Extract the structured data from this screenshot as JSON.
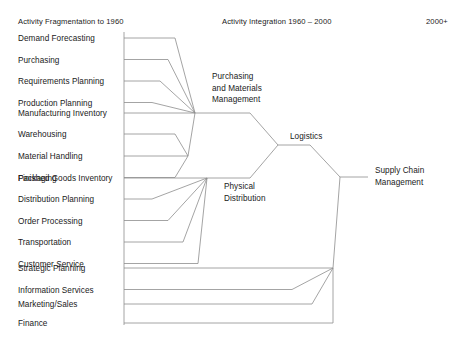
{
  "diagram": {
    "headers": [
      {
        "text": "Activity Fragmentation to 1960",
        "x": 18,
        "y": 17
      },
      {
        "text": "Activity Integration 1960 – 2000",
        "x": 222,
        "y": 17
      },
      {
        "text": "2000+",
        "x": 426,
        "y": 17
      }
    ],
    "spine": {
      "x": 124,
      "y_top": 32,
      "y_bottom": 325
    },
    "activities": [
      {
        "label": "Demand Forecasting",
        "y": 38,
        "elbow": 175,
        "group": "pmm"
      },
      {
        "label": "Purchasing",
        "y": 59.5,
        "elbow": 168,
        "group": "pmm"
      },
      {
        "label": "Requirements Planning",
        "y": 81,
        "elbow": 160,
        "group": "pmm"
      },
      {
        "label": "Production Planning",
        "y": 102.5,
        "elbow": 152,
        "group": "pmm"
      },
      {
        "label": "Manufacturing Inventory",
        "y": 113,
        "elbow": 195,
        "group": "pmm-direct"
      },
      {
        "label": "Warehousing",
        "y": 134,
        "elbow": 188,
        "group": "pd-upper"
      },
      {
        "label": "Material Handling",
        "y": 156,
        "elbow": 188,
        "group": "pd-direct"
      },
      {
        "label": "Packaging",
        "y": 177.5,
        "elbow": 188,
        "group": "pd-upper"
      },
      {
        "label": "Finished Goods Inventory",
        "y": 178,
        "elbow": 207,
        "group": "pd-direct2"
      },
      {
        "label": "Distribution Planning",
        "y": 199,
        "elbow": 152,
        "group": "pd"
      },
      {
        "label": "Order Processing",
        "y": 220.5,
        "elbow": 168,
        "group": "pd"
      },
      {
        "label": "Transportation",
        "y": 242,
        "elbow": 183,
        "group": "pd"
      },
      {
        "label": "Customer Service",
        "y": 263.5,
        "elbow": 198,
        "group": "pd"
      },
      {
        "label": "Strategic Planning",
        "y": 268,
        "elbow": 333,
        "group": "scm"
      },
      {
        "label": "Information Services",
        "y": 289.5,
        "elbow": 292,
        "group": "scm"
      },
      {
        "label": "Marketing/Sales",
        "y": 304,
        "elbow": 312,
        "group": "scm"
      },
      {
        "label": "Finance",
        "y": 323,
        "elbow": 333,
        "group": "scm"
      }
    ],
    "nodes": [
      {
        "id": "pmm",
        "label": "Purchasing\nand Materials\nManagement",
        "label_x": 212,
        "label_y": 71,
        "junction_x": 195,
        "junction_y": 113
      },
      {
        "id": "pd",
        "label": "Physical\nDistribution",
        "label_x": 224,
        "label_y": 181,
        "junction_x": 207,
        "junction_y": 178
      },
      {
        "id": "logistics",
        "label": "Logistics",
        "label_x": 290,
        "label_y": 131,
        "junction_x": 278,
        "junction_y": 145
      },
      {
        "id": "scm",
        "label": "Supply Chain\nManagement",
        "label_x": 375,
        "label_y": 165,
        "junction_x": 340,
        "junction_y": 177
      }
    ],
    "wires": [
      "M124,38 L175,38 L195,113",
      "M124,59.5 L168,59.5 L195,113",
      "M124,81 L160,81 L195,113",
      "M124,102.5 L152,102.5 L195,113",
      "M124,113 L195,113",
      "M124,134 L175,134 L188,156",
      "M124,156 L188,156",
      "M124,177.5 L175,177.5 L188,156",
      "M188,156 L195,113",
      "M124,178 L207,178",
      "M124,199 L152,199 L207,178",
      "M124,220.5 L168,220.5 L207,178",
      "M124,242 L183,242 L207,178",
      "M124,263.5 L198,263.5 L207,178",
      "M195,113 L250,113 L278,145",
      "M207,178 L250,178 L278,145",
      "M278,145 L310,145 L340,177",
      "M124,268 L333,268",
      "M124,289.5 L292,289.5 L333,268",
      "M124,304 L312,304 L333,268",
      "M124,323 L333,323 L333,268",
      "M333,268 L340,177",
      "M340,177 L368,177"
    ]
  }
}
